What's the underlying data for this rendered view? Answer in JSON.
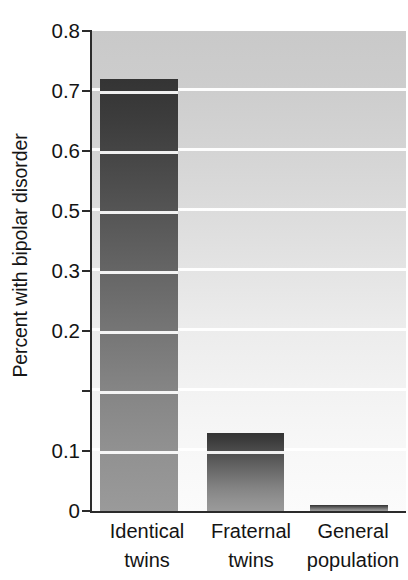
{
  "chart": {
    "type": "bar",
    "ylabel": "Percent with bipolar disorder",
    "xlabel": "",
    "title": "",
    "grid": true,
    "legend": "none",
    "ylim": [
      0,
      0.8
    ],
    "ytick_labels": [
      "0.8",
      "0.7",
      "0.6",
      "0.5",
      "0.3",
      "0.2",
      "0.1",
      "0"
    ],
    "ytick_values": [
      0.8,
      0.7,
      0.6,
      0.5,
      0.4,
      0.3,
      0.2,
      0.1,
      0.0
    ]
  },
  "chart_data": {
    "type": "bar",
    "title": "",
    "xlabel": "",
    "ylabel": "Percent with bipolar disorder",
    "ylim": [
      0,
      0.8
    ],
    "grid": true,
    "legend": "none",
    "categories": [
      "Identical twins",
      "Fraternal twins",
      "General population"
    ],
    "category_lines": [
      [
        "Identical",
        "twins"
      ],
      [
        "Fraternal",
        "twins"
      ],
      [
        "General",
        "population"
      ]
    ],
    "values": [
      0.72,
      0.13,
      0.01
    ],
    "ytick_labels": [
      "0.8",
      "0.7",
      "0.6",
      "0.5",
      "0.3",
      "0.2",
      "0.1",
      "0"
    ],
    "ytick_positions": [
      0.8,
      0.7,
      0.6,
      0.5,
      0.4,
      0.3,
      0.2,
      0.1,
      0.0
    ],
    "gridline_values": [
      0.7,
      0.6,
      0.5,
      0.4,
      0.3,
      0.2,
      0.1
    ],
    "note": "Y axis tick labels as printed skip 0.4; the fifth gridline from the top is labeled 0.3."
  },
  "colors": {
    "bar_top": "#343434",
    "bar_bottom": "#9a9a9a",
    "plot_bg_top": "#c9c9c9",
    "plot_bg_bottom": "#fbfbfb",
    "gridline": "#ffffff",
    "axis": "#2b2b2b",
    "text": "#141414",
    "page_bg": "#ffffff"
  }
}
